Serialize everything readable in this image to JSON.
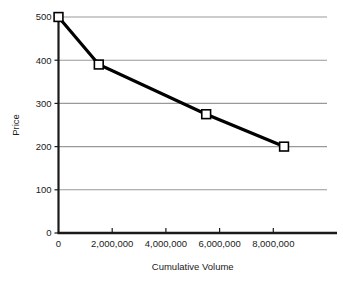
{
  "chart_data": {
    "type": "line",
    "title": "",
    "xlabel": "Cumulative Volume",
    "ylabel": "Price",
    "xlim": [
      0,
      10000000
    ],
    "ylim": [
      0,
      500
    ],
    "grid": true,
    "legend": null,
    "marker": "open-square",
    "line_color": "#000000",
    "grid_color": "#999999",
    "axis_color": "#1a1a1a",
    "marker_fill": "#ffffff",
    "marker_edge": "#000000",
    "x_ticks": [
      0,
      2000000,
      4000000,
      6000000,
      8000000
    ],
    "x_tick_labels": [
      "0",
      "2,000,000",
      "4,000,000",
      "6,000,000",
      "8,000,000"
    ],
    "y_ticks": [
      0,
      100,
      200,
      300,
      400,
      500
    ],
    "y_tick_labels": [
      "0",
      "100",
      "200",
      "300",
      "400",
      "500"
    ],
    "series": [
      {
        "name": "Price vs Cumulative Volume",
        "x": [
          0,
          1500000,
          5500000,
          8400000
        ],
        "y": [
          500,
          390,
          275,
          200
        ]
      }
    ]
  }
}
